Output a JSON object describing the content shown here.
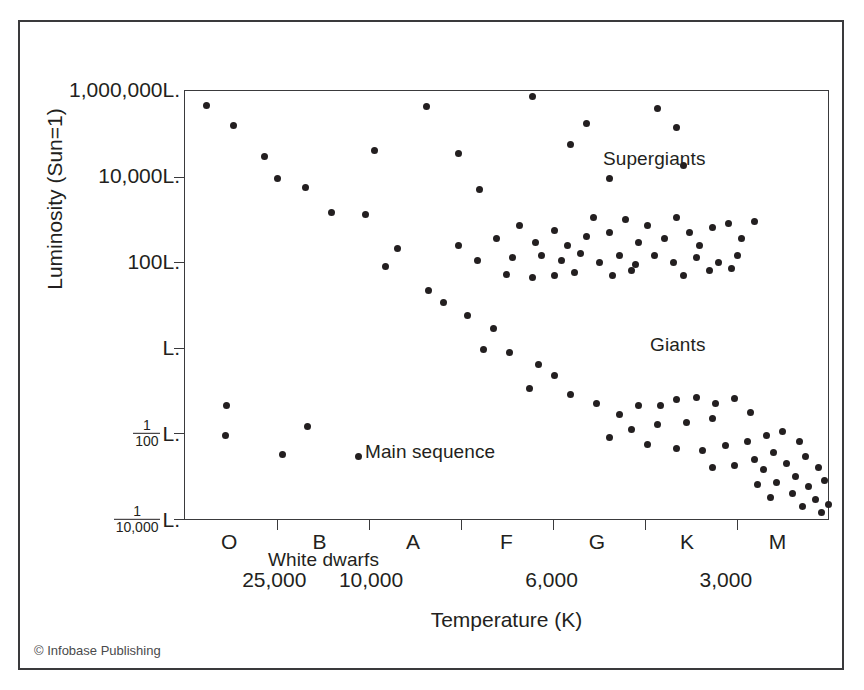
{
  "figure": {
    "credit": "© Infobase Publishing",
    "background": "#ffffff",
    "ink": "#231f20"
  },
  "axes": {
    "x_axis_title": "Temperature (K)",
    "y_axis_title": "Luminosity (Sun=1)",
    "y_tick_labels": [
      {
        "text": "1,000,000L.",
        "pos_pct": 0
      },
      {
        "text": "10,000L.",
        "pos_pct": 20
      },
      {
        "text": "100L.",
        "pos_pct": 40
      },
      {
        "text": "L.",
        "pos_pct": 60
      },
      {
        "text": "1/100 L.",
        "num": "1",
        "den": "100",
        "suffix": "L.",
        "pos_pct": 80
      },
      {
        "text": "1/10,000 L.",
        "num": "1",
        "den": "10,000",
        "suffix": "L.",
        "pos_pct": 100
      }
    ],
    "x_class_labels": [
      {
        "text": "O",
        "pos_pct": 7
      },
      {
        "text": "B",
        "pos_pct": 21
      },
      {
        "text": "A",
        "pos_pct": 35.5
      },
      {
        "text": "F",
        "pos_pct": 50
      },
      {
        "text": "G",
        "pos_pct": 64
      },
      {
        "text": "K",
        "pos_pct": 78
      },
      {
        "text": "M",
        "pos_pct": 92
      }
    ],
    "x_ticks_pct": [
      14.3,
      28.6,
      42.9,
      57.2,
      71.5,
      85.8
    ],
    "x_temp_labels": [
      {
        "text": "25,000",
        "pos_pct": 14
      },
      {
        "text": "10,000",
        "pos_pct": 29
      },
      {
        "text": "6,000",
        "pos_pct": 57
      },
      {
        "text": "3,000",
        "pos_pct": 84
      }
    ]
  },
  "cluster_labels": {
    "supergiants": "Supergiants",
    "giants": "Giants",
    "main_sequence": "Main sequence",
    "white_dwarfs": "White dwarfs"
  },
  "chart_data": {
    "type": "scatter",
    "xlabel": "Temperature (K)",
    "ylabel": "Luminosity (Sun=1)",
    "x_axis_note": "Spectral class O B A F G K M, temperature decreasing left to right (25,000 K to under 3,000 K)",
    "y_axis_note": "Logarithmic luminosity from 1,000,000 solar luminosities (top) to 1/10,000 solar luminosities (bottom)",
    "grid": false,
    "legend": "none",
    "annotations": [
      "Supergiants",
      "Giants",
      "Main sequence",
      "White dwarfs"
    ],
    "series": [
      {
        "name": "Main sequence",
        "points_pct": [
          [
            3.3,
            3.5
          ],
          [
            7.5,
            8.1
          ],
          [
            12.4,
            15.3
          ],
          [
            14.4,
            20.5
          ],
          [
            18.7,
            22.6
          ],
          [
            22.8,
            28.5
          ],
          [
            28.0,
            28.8
          ],
          [
            33.0,
            36.7
          ],
          [
            31.2,
            41.0
          ],
          [
            37.8,
            46.5
          ],
          [
            40.2,
            49.5
          ],
          [
            44.0,
            52.5
          ],
          [
            48.0,
            55.5
          ],
          [
            46.5,
            60.5
          ],
          [
            50.5,
            61.0
          ],
          [
            55.0,
            64.0
          ],
          [
            57.5,
            66.5
          ],
          [
            53.5,
            69.6
          ],
          [
            60.0,
            71.0
          ],
          [
            64.0,
            73.0
          ],
          [
            67.5,
            75.5
          ],
          [
            70.5,
            73.5
          ],
          [
            74.0,
            73.5
          ],
          [
            76.5,
            72.0
          ],
          [
            79.5,
            71.5
          ],
          [
            82.5,
            73.0
          ],
          [
            85.5,
            71.8
          ],
          [
            88.0,
            75.0
          ],
          [
            82.0,
            76.5
          ],
          [
            78.0,
            77.5
          ],
          [
            73.5,
            78.0
          ],
          [
            69.5,
            79.0
          ],
          [
            66.0,
            81.0
          ],
          [
            72.0,
            82.5
          ],
          [
            76.5,
            83.5
          ],
          [
            80.5,
            84.0
          ],
          [
            84.0,
            82.8
          ],
          [
            87.5,
            82.0
          ],
          [
            90.5,
            80.5
          ],
          [
            93.0,
            79.5
          ],
          [
            95.5,
            82.0
          ],
          [
            91.5,
            84.5
          ],
          [
            88.5,
            86.0
          ],
          [
            85.5,
            87.5
          ],
          [
            82.0,
            88.0
          ],
          [
            90.0,
            88.5
          ],
          [
            93.5,
            87.0
          ],
          [
            96.5,
            85.5
          ],
          [
            98.5,
            88.0
          ],
          [
            95.0,
            90.0
          ],
          [
            92.0,
            91.5
          ],
          [
            89.0,
            92.0
          ],
          [
            97.0,
            92.5
          ],
          [
            99.5,
            91.0
          ],
          [
            94.5,
            94.0
          ],
          [
            91.0,
            95.0
          ],
          [
            98.0,
            95.5
          ],
          [
            96.0,
            97.0
          ],
          [
            99.0,
            98.5
          ],
          [
            100.0,
            96.5
          ]
        ]
      },
      {
        "name": "Supergiants",
        "points_pct": [
          [
            37.5,
            3.6
          ],
          [
            54.0,
            1.2
          ],
          [
            62.5,
            7.5
          ],
          [
            60.0,
            12.5
          ],
          [
            73.5,
            4.0
          ],
          [
            76.5,
            8.5
          ],
          [
            77.5,
            17.5
          ],
          [
            66.0,
            20.5
          ],
          [
            42.5,
            14.5
          ],
          [
            29.5,
            14.0
          ],
          [
            45.8,
            23.0
          ]
        ]
      },
      {
        "name": "Giants",
        "points_pct": [
          [
            42.5,
            36.0
          ],
          [
            48.5,
            34.5
          ],
          [
            52.0,
            31.5
          ],
          [
            54.5,
            35.5
          ],
          [
            57.5,
            32.5
          ],
          [
            59.5,
            36.0
          ],
          [
            62.5,
            34.0
          ],
          [
            63.5,
            29.5
          ],
          [
            66.0,
            33.0
          ],
          [
            68.5,
            30.0
          ],
          [
            70.5,
            35.5
          ],
          [
            72.0,
            31.5
          ],
          [
            74.5,
            34.5
          ],
          [
            76.5,
            29.5
          ],
          [
            78.5,
            33.0
          ],
          [
            80.0,
            36.0
          ],
          [
            82.0,
            32.0
          ],
          [
            84.5,
            31.0
          ],
          [
            86.5,
            34.5
          ],
          [
            88.5,
            30.5
          ],
          [
            51.0,
            39.0
          ],
          [
            55.5,
            38.5
          ],
          [
            58.5,
            39.5
          ],
          [
            61.5,
            38.0
          ],
          [
            64.5,
            40.0
          ],
          [
            67.5,
            38.5
          ],
          [
            70.0,
            40.5
          ],
          [
            73.0,
            38.5
          ],
          [
            76.0,
            40.0
          ],
          [
            79.5,
            39.0
          ],
          [
            83.0,
            40.0
          ],
          [
            86.0,
            38.5
          ],
          [
            50.0,
            42.8
          ],
          [
            54.0,
            43.5
          ],
          [
            57.5,
            43.0
          ],
          [
            60.5,
            42.5
          ],
          [
            66.5,
            43.0
          ],
          [
            69.5,
            42.0
          ],
          [
            77.5,
            43.0
          ],
          [
            81.5,
            42.0
          ],
          [
            85.0,
            41.5
          ],
          [
            45.5,
            39.5
          ]
        ]
      },
      {
        "name": "White dwarfs",
        "points_pct": [
          [
            6.5,
            73.5
          ],
          [
            6.3,
            80.5
          ],
          [
            15.2,
            85.0
          ],
          [
            19.0,
            78.5
          ],
          [
            27.0,
            85.5
          ]
        ]
      }
    ]
  }
}
